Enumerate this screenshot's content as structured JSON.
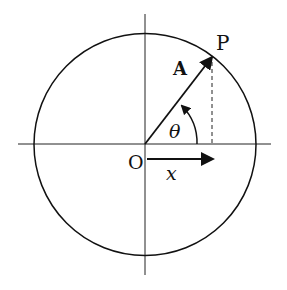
{
  "diagram": {
    "labels": {
      "point": "P",
      "vector": "A",
      "angle": "θ",
      "origin": "O",
      "projection": "x"
    },
    "colors": {
      "stroke": "#111111",
      "background": "#ffffff"
    },
    "geometry": {
      "center": [
        145,
        144
      ],
      "radius": 112,
      "point_P": [
        212,
        57
      ],
      "angle_deg": 52
    }
  }
}
